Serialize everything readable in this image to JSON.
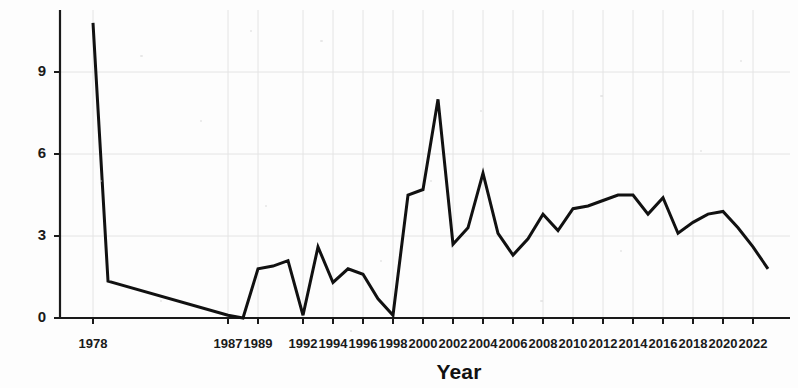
{
  "chart_data": {
    "type": "line",
    "title": "",
    "xlabel": "Year",
    "ylabel": "Citations",
    "xlim": [
      1977.5,
      2023.5
    ],
    "ylim": [
      -0.4,
      11.2
    ],
    "yticks": [
      0,
      3,
      6,
      9
    ],
    "ytick_labels": [
      "0",
      "3",
      "6",
      "9"
    ],
    "xticks": [
      1978,
      1987,
      1989,
      1992,
      1994,
      1996,
      1998,
      2000,
      2002,
      2004,
      2006,
      2008,
      2010,
      2012,
      2014,
      2016,
      2018,
      2020,
      2022
    ],
    "xtick_labels": [
      "1978",
      "1987",
      "1989",
      "1992",
      "1994",
      "1996",
      "1998",
      "2000",
      "2002",
      "2004",
      "2006",
      "2008",
      "2010",
      "2012",
      "2014",
      "2016",
      "2018",
      "2020",
      "2022"
    ],
    "grid": true,
    "grid_color": "#e4e4e4",
    "line_color": "#111111",
    "line_width": 3,
    "legend": null,
    "x": [
      1978,
      1979,
      1987,
      1988,
      1989,
      1990,
      1991,
      1992,
      1993,
      1994,
      1995,
      1996,
      1997,
      1998,
      1999,
      2000,
      2001,
      2002,
      2003,
      2004,
      2005,
      2006,
      2007,
      2008,
      2009,
      2010,
      2011,
      2012,
      2013,
      2014,
      2015,
      2016,
      2017,
      2018,
      2019,
      2020,
      2021,
      2022,
      2023
    ],
    "values": [
      10.8,
      1.35,
      0.1,
      0.0,
      1.8,
      1.9,
      2.1,
      0.1,
      2.6,
      1.3,
      1.8,
      1.6,
      0.7,
      0.1,
      4.5,
      4.7,
      8.0,
      2.7,
      3.3,
      5.3,
      3.1,
      2.3,
      2.9,
      3.8,
      3.2,
      4.0,
      4.1,
      4.3,
      4.5,
      4.5,
      3.8,
      4.4,
      3.1,
      3.5,
      3.8,
      3.9,
      3.3,
      2.6,
      1.8
    ]
  },
  "axes": {
    "y_title": "Citations",
    "x_title": "Year"
  }
}
